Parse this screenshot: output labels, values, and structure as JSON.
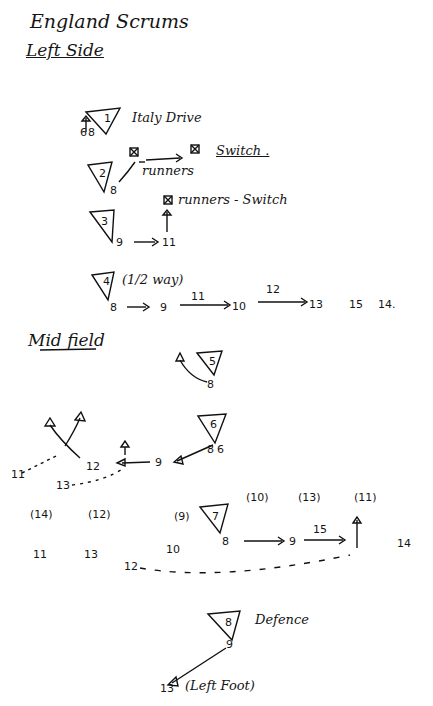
{
  "title": "England Scrums",
  "sections": {
    "left_side": {
      "heading": "Left Side",
      "plays": [
        {
          "number": "1",
          "note": "Italy Drive",
          "players": [
            "6",
            "8"
          ]
        },
        {
          "number": "2",
          "player": "8",
          "move_label": "runners",
          "result": "Switch ."
        },
        {
          "number": "3",
          "pass": [
            "9",
            "11"
          ],
          "result": "runners - Switch"
        },
        {
          "number": "4",
          "note": "(1/2 way)",
          "sequence": [
            "8",
            "9",
            "10",
            "13"
          ],
          "pass_labels": [
            "11",
            "12"
          ],
          "extras": [
            "15",
            "14."
          ]
        }
      ]
    },
    "midfield": {
      "heading": "Mid field",
      "plays": [
        {
          "number": "5",
          "player": "8"
        },
        {
          "number": "6",
          "players": [
            "8",
            "6"
          ],
          "sequence": [
            "9",
            "12"
          ],
          "loops": [
            "11",
            "13"
          ]
        },
        {
          "number": "7",
          "sequence": [
            "8",
            "9"
          ],
          "pass_label": "15",
          "brackets": [
            "(14)",
            "(12)",
            "(9)",
            "(10)",
            "(13)",
            "(11)"
          ],
          "row": [
            "11",
            "13",
            "10",
            "14"
          ],
          "loop": "12"
        }
      ]
    },
    "defence": {
      "play": {
        "number": "8",
        "note": "Defence",
        "player": "9",
        "target": "13",
        "target_note": "(Left Foot)"
      }
    }
  }
}
